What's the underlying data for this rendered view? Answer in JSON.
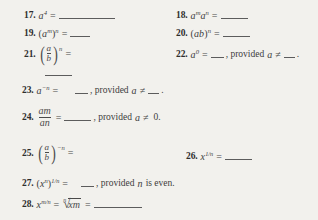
{
  "page": {
    "background_color": "#f2f1ed",
    "text_color": "#3d3d3d",
    "kind": "textbook-exercise-list",
    "topic": "Laws of exponents fill-in-the-blank exercises",
    "item_range": "17-28"
  },
  "symbols": {
    "equals": "=",
    "not_equal": "≠",
    "radical": "√",
    "paren_open": "(",
    "paren_close": ")"
  },
  "exercises": [
    {
      "number": "17.",
      "base": "a",
      "exponent": "4",
      "equals": "=",
      "blank": "long",
      "column": "left"
    },
    {
      "number": "18.",
      "base_first": "a",
      "exp_first": "m",
      "base_second": "a",
      "exp_second": "n",
      "equals": "=",
      "blank": "med",
      "column": "right"
    },
    {
      "number": "19.",
      "inner_base": "a",
      "inner_exp": "m",
      "outer_exp": "n",
      "equals": "=",
      "blank": "short",
      "column": "left"
    },
    {
      "number": "20.",
      "inner": "ab",
      "outer_exp": "n",
      "equals": "=",
      "blank": "med",
      "column": "right"
    },
    {
      "number": "21.",
      "numerator": "a",
      "denominator": "b",
      "outer_exp": "n",
      "equals": "=",
      "blank": "med",
      "column": "left"
    },
    {
      "number": "22.",
      "base": "a",
      "exponent": "0",
      "equals": "=",
      "blank": "tiny",
      "provided_prefix": ", provided",
      "provided_var": "a",
      "provided_rel": "≠",
      "provided_blank": "mini",
      "provided_suffix": ".",
      "column": "right"
    },
    {
      "number": "23.",
      "base": "a",
      "exponent": "−n",
      "equals": "=",
      "blank": "tiny",
      "provided_prefix": ", provided",
      "provided_var": "a",
      "provided_rel": "≠",
      "provided_blank": "mini",
      "provided_suffix": ".",
      "column": "wide"
    },
    {
      "number": "24.",
      "numerator_base": "a",
      "numerator_exp": "m",
      "denominator_base": "a",
      "denominator_exp": "n",
      "equals": "=",
      "blank": "med",
      "provided_prefix": ", provided",
      "provided_var": "a",
      "provided_rel": "≠",
      "provided_value": "0.",
      "column": "wide"
    },
    {
      "number": "25.",
      "numerator": "a",
      "denominator": "b",
      "outer_exp": "−n",
      "equals": "=",
      "blank": "none",
      "column": "left"
    },
    {
      "number": "26.",
      "base": "x",
      "exponent": "1/n",
      "equals": "=",
      "blank": "med",
      "column": "right"
    },
    {
      "number": "27.",
      "inner_base": "x",
      "inner_exp": "n",
      "outer_exp": "1/n",
      "equals": "=",
      "blank": "tiny",
      "provided_prefix": ", provided",
      "provided_var": "n",
      "provided_suffix": "is even.",
      "column": "wide"
    },
    {
      "number": "28.",
      "base": "x",
      "exponent": "m/n",
      "equals_first": "=",
      "radical_index": "n",
      "radicand_base": "x",
      "radicand_exp": "m",
      "equals_second": "=",
      "blank": "long",
      "column": "wide"
    }
  ]
}
